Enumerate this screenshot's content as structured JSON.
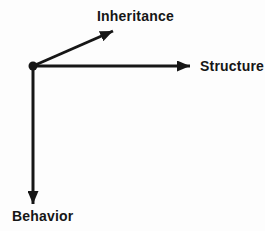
{
  "diagram": {
    "type": "axes-diagram",
    "colors": {
      "background": "#fdfdfd",
      "line": "#161616",
      "text": "#161616"
    },
    "origin_node": {
      "shape": "dot"
    },
    "arrows": [
      {
        "label": "Inheritance",
        "direction": "up-right"
      },
      {
        "label": "Structure",
        "direction": "right"
      },
      {
        "label": "Behavior",
        "direction": "down"
      }
    ]
  }
}
